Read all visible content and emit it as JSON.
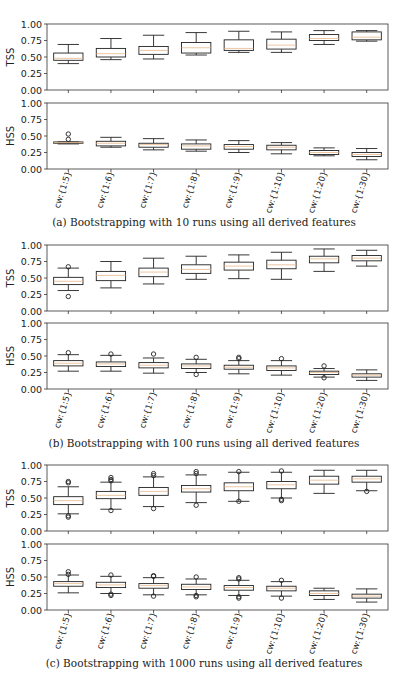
{
  "figure": {
    "panels": [
      {
        "id": "a",
        "caption": "(a) Bootstrapping with 10 runs using all derived features"
      },
      {
        "id": "b",
        "caption": "(b) Bootstrapping with 100 runs using all derived features"
      },
      {
        "id": "c",
        "caption": "(c) Bootstrapping with 1000 runs using all derived features"
      }
    ]
  },
  "chart_data": [
    {
      "type": "box",
      "panel": "a",
      "title": "(a) Bootstrapping with 10 runs using all derived features",
      "categories": [
        "cw:{1:5}",
        "cw:{1:6}",
        "cw:{1:7}",
        "cw:{1:8}",
        "cw:{1:9}",
        "cw:{1:10}",
        "cw:{1:20}",
        "cw:{1:30}"
      ],
      "yticks": [
        "0.00",
        "0.25",
        "0.50",
        "0.75",
        "1.00"
      ],
      "ylim": [
        0,
        1
      ],
      "subplots": [
        {
          "ylabel": "TSS",
          "boxes": [
            {
              "whislo": 0.4,
              "q1": 0.45,
              "med": 0.48,
              "q3": 0.56,
              "whishi": 0.69,
              "fliers": []
            },
            {
              "whislo": 0.46,
              "q1": 0.5,
              "med": 0.55,
              "q3": 0.63,
              "whishi": 0.78,
              "fliers": []
            },
            {
              "whislo": 0.47,
              "q1": 0.54,
              "med": 0.6,
              "q3": 0.66,
              "whishi": 0.83,
              "fliers": []
            },
            {
              "whislo": 0.53,
              "q1": 0.56,
              "med": 0.64,
              "q3": 0.72,
              "whishi": 0.87,
              "fliers": []
            },
            {
              "whislo": 0.57,
              "q1": 0.6,
              "med": 0.63,
              "q3": 0.76,
              "whishi": 0.89,
              "fliers": []
            },
            {
              "whislo": 0.57,
              "q1": 0.62,
              "med": 0.68,
              "q3": 0.77,
              "whishi": 0.88,
              "fliers": []
            },
            {
              "whislo": 0.69,
              "q1": 0.75,
              "med": 0.78,
              "q3": 0.84,
              "whishi": 0.9,
              "fliers": []
            },
            {
              "whislo": 0.74,
              "q1": 0.76,
              "med": 0.8,
              "q3": 0.88,
              "whishi": 0.9,
              "fliers": []
            }
          ]
        },
        {
          "ylabel": "HSS",
          "boxes": [
            {
              "whislo": 0.38,
              "q1": 0.39,
              "med": 0.4,
              "q3": 0.41,
              "whishi": 0.41,
              "fliers": [
                0.45,
                0.53
              ]
            },
            {
              "whislo": 0.33,
              "q1": 0.35,
              "med": 0.39,
              "q3": 0.42,
              "whishi": 0.48,
              "fliers": []
            },
            {
              "whislo": 0.29,
              "q1": 0.33,
              "med": 0.37,
              "q3": 0.39,
              "whishi": 0.46,
              "fliers": []
            },
            {
              "whislo": 0.27,
              "q1": 0.3,
              "med": 0.35,
              "q3": 0.38,
              "whishi": 0.44,
              "fliers": []
            },
            {
              "whislo": 0.25,
              "q1": 0.3,
              "med": 0.34,
              "q3": 0.37,
              "whishi": 0.43,
              "fliers": []
            },
            {
              "whislo": 0.23,
              "q1": 0.29,
              "med": 0.33,
              "q3": 0.36,
              "whishi": 0.4,
              "fliers": []
            },
            {
              "whislo": 0.2,
              "q1": 0.22,
              "med": 0.25,
              "q3": 0.28,
              "whishi": 0.32,
              "fliers": []
            },
            {
              "whislo": 0.14,
              "q1": 0.19,
              "med": 0.22,
              "q3": 0.25,
              "whishi": 0.31,
              "fliers": []
            }
          ]
        }
      ]
    },
    {
      "type": "box",
      "panel": "b",
      "title": "(b) Bootstrapping with 100 runs using all derived features",
      "categories": [
        "cw:{1:5}",
        "cw:{1:6}",
        "cw:{1:7}",
        "cw:{1:8}",
        "cw:{1:9}",
        "cw:{1:10}",
        "cw:{1:20}",
        "cw:{1:30}"
      ],
      "yticks": [
        "0.00",
        "0.25",
        "0.50",
        "0.75",
        "1.00"
      ],
      "ylim": [
        0,
        1
      ],
      "subplots": [
        {
          "ylabel": "TSS",
          "boxes": [
            {
              "whislo": 0.31,
              "q1": 0.4,
              "med": 0.45,
              "q3": 0.51,
              "whishi": 0.65,
              "fliers": [
                0.22,
                0.67
              ]
            },
            {
              "whislo": 0.35,
              "q1": 0.46,
              "med": 0.54,
              "q3": 0.6,
              "whishi": 0.75,
              "fliers": []
            },
            {
              "whislo": 0.41,
              "q1": 0.52,
              "med": 0.59,
              "q3": 0.65,
              "whishi": 0.8,
              "fliers": []
            },
            {
              "whislo": 0.48,
              "q1": 0.57,
              "med": 0.63,
              "q3": 0.7,
              "whishi": 0.83,
              "fliers": []
            },
            {
              "whislo": 0.49,
              "q1": 0.62,
              "med": 0.68,
              "q3": 0.74,
              "whishi": 0.85,
              "fliers": []
            },
            {
              "whislo": 0.48,
              "q1": 0.64,
              "med": 0.7,
              "q3": 0.77,
              "whishi": 0.89,
              "fliers": []
            },
            {
              "whislo": 0.6,
              "q1": 0.73,
              "med": 0.79,
              "q3": 0.83,
              "whishi": 0.94,
              "fliers": []
            },
            {
              "whislo": 0.68,
              "q1": 0.76,
              "med": 0.8,
              "q3": 0.84,
              "whishi": 0.92,
              "fliers": []
            }
          ]
        },
        {
          "ylabel": "HSS",
          "boxes": [
            {
              "whislo": 0.27,
              "q1": 0.35,
              "med": 0.39,
              "q3": 0.43,
              "whishi": 0.52,
              "fliers": [
                0.55
              ]
            },
            {
              "whislo": 0.27,
              "q1": 0.34,
              "med": 0.38,
              "q3": 0.41,
              "whishi": 0.51,
              "fliers": [
                0.53
              ]
            },
            {
              "whislo": 0.24,
              "q1": 0.32,
              "med": 0.36,
              "q3": 0.4,
              "whishi": 0.47,
              "fliers": [
                0.53
              ]
            },
            {
              "whislo": 0.25,
              "q1": 0.31,
              "med": 0.35,
              "q3": 0.38,
              "whishi": 0.45,
              "fliers": [
                0.22,
                0.48
              ]
            },
            {
              "whislo": 0.23,
              "q1": 0.3,
              "med": 0.33,
              "q3": 0.36,
              "whishi": 0.43,
              "fliers": [
                0.46,
                0.48
              ]
            },
            {
              "whislo": 0.21,
              "q1": 0.28,
              "med": 0.32,
              "q3": 0.35,
              "whishi": 0.43,
              "fliers": [
                0.46
              ]
            },
            {
              "whislo": 0.18,
              "q1": 0.22,
              "med": 0.25,
              "q3": 0.27,
              "whishi": 0.31,
              "fliers": [
                0.17,
                0.35
              ]
            },
            {
              "whislo": 0.13,
              "q1": 0.18,
              "med": 0.21,
              "q3": 0.23,
              "whishi": 0.29,
              "fliers": []
            }
          ]
        }
      ]
    },
    {
      "type": "box",
      "panel": "c",
      "title": "(c) Bootstrapping with 1000 runs using all derived features",
      "categories": [
        "cw:{1:5}",
        "cw:{1:6}",
        "cw:{1:7}",
        "cw:{1:8}",
        "cw:{1:9}",
        "cw:{1:10}",
        "cw:{1:20}",
        "cw:{1:30}"
      ],
      "yticks": [
        "0.00",
        "0.25",
        "0.50",
        "0.75",
        "1.00"
      ],
      "ylim": [
        0,
        1
      ],
      "subplots": [
        {
          "ylabel": "TSS",
          "boxes": [
            {
              "whislo": 0.26,
              "q1": 0.4,
              "med": 0.46,
              "q3": 0.52,
              "whishi": 0.67,
              "fliers": [
                0.21,
                0.23,
                0.73,
                0.75
              ]
            },
            {
              "whislo": 0.33,
              "q1": 0.49,
              "med": 0.54,
              "q3": 0.6,
              "whishi": 0.74,
              "fliers": [
                0.31,
                0.76,
                0.78,
                0.81
              ]
            },
            {
              "whislo": 0.37,
              "q1": 0.54,
              "med": 0.6,
              "q3": 0.66,
              "whishi": 0.82,
              "fliers": [
                0.34,
                0.84,
                0.87
              ]
            },
            {
              "whislo": 0.43,
              "q1": 0.59,
              "med": 0.64,
              "q3": 0.69,
              "whishi": 0.85,
              "fliers": [
                0.39,
                0.87,
                0.9
              ]
            },
            {
              "whislo": 0.45,
              "q1": 0.61,
              "med": 0.67,
              "q3": 0.73,
              "whishi": 0.89,
              "fliers": [
                0.45,
                0.9
              ]
            },
            {
              "whislo": 0.5,
              "q1": 0.64,
              "med": 0.7,
              "q3": 0.75,
              "whishi": 0.89,
              "fliers": [
                0.46,
                0.48,
                0.91
              ]
            },
            {
              "whislo": 0.57,
              "q1": 0.71,
              "med": 0.77,
              "q3": 0.83,
              "whishi": 0.92,
              "fliers": []
            },
            {
              "whislo": 0.61,
              "q1": 0.74,
              "med": 0.79,
              "q3": 0.83,
              "whishi": 0.92,
              "fliers": [
                0.6
              ]
            }
          ]
        },
        {
          "ylabel": "HSS",
          "boxes": [
            {
              "whislo": 0.26,
              "q1": 0.36,
              "med": 0.4,
              "q3": 0.43,
              "whishi": 0.53,
              "fliers": [
                0.54,
                0.58
              ]
            },
            {
              "whislo": 0.25,
              "q1": 0.34,
              "med": 0.38,
              "q3": 0.42,
              "whishi": 0.51,
              "fliers": [
                0.22,
                0.24,
                0.53
              ]
            },
            {
              "whislo": 0.23,
              "q1": 0.33,
              "med": 0.37,
              "q3": 0.4,
              "whishi": 0.49,
              "fliers": [
                0.21,
                0.51,
                0.52
              ]
            },
            {
              "whislo": 0.23,
              "q1": 0.31,
              "med": 0.35,
              "q3": 0.39,
              "whishi": 0.47,
              "fliers": [
                0.2,
                0.22,
                0.5
              ]
            },
            {
              "whislo": 0.22,
              "q1": 0.3,
              "med": 0.34,
              "q3": 0.37,
              "whishi": 0.45,
              "fliers": [
                0.18,
                0.2,
                0.47,
                0.49
              ]
            },
            {
              "whislo": 0.21,
              "q1": 0.29,
              "med": 0.33,
              "q3": 0.36,
              "whishi": 0.43,
              "fliers": [
                0.18,
                0.45
              ]
            },
            {
              "whislo": 0.16,
              "q1": 0.22,
              "med": 0.25,
              "q3": 0.29,
              "whishi": 0.33,
              "fliers": []
            },
            {
              "whislo": 0.12,
              "q1": 0.18,
              "med": 0.21,
              "q3": 0.24,
              "whishi": 0.32,
              "fliers": []
            }
          ]
        }
      ]
    }
  ],
  "layout": {
    "plot_left": 47,
    "plot_right": 388,
    "panels": [
      {
        "tss_top": 24,
        "tss_bottom": 90,
        "hss_top": 103,
        "hss_bottom": 169,
        "ticklabel_y": 172,
        "caption_y": 216
      },
      {
        "tss_top": 245,
        "tss_bottom": 311,
        "hss_top": 323,
        "hss_bottom": 389,
        "ticklabel_y": 392,
        "caption_y": 437
      },
      {
        "tss_top": 465,
        "tss_bottom": 531,
        "hss_top": 544,
        "hss_bottom": 610,
        "ticklabel_y": 613,
        "caption_y": 657
      }
    ]
  }
}
